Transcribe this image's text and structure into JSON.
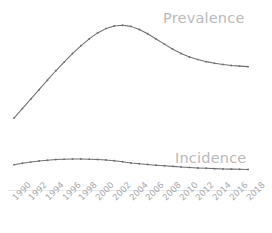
{
  "chart_data": {
    "type": "line",
    "title": "",
    "subtitle": "",
    "xlabel": "",
    "ylabel": "",
    "grid": false,
    "legend_position": "inline-right",
    "x": [
      1990,
      1991,
      1992,
      1993,
      1994,
      1995,
      1996,
      1997,
      1998,
      1999,
      2000,
      2001,
      2002,
      2003,
      2004,
      2005,
      2006,
      2007,
      2008,
      2009,
      2010,
      2011,
      2012,
      2013,
      2014,
      2015,
      2016,
      2017,
      2018
    ],
    "tick_labels": [
      "1990",
      "1992",
      "1994",
      "1996",
      "1998",
      "2000",
      "2002",
      "2004",
      "2006",
      "2008",
      "2010",
      "2012",
      "2014",
      "2016",
      "2018"
    ],
    "xlim": [
      1990,
      2018
    ],
    "ylim": [
      0,
      100
    ],
    "series": [
      {
        "name": "Prevalence",
        "color": "#6e6e74",
        "marker": "dot",
        "values": [
          39.5,
          45.0,
          50.5,
          56.0,
          61.5,
          67.0,
          72.0,
          77.0,
          81.5,
          85.5,
          89.0,
          91.5,
          93.0,
          93.5,
          92.8,
          91.0,
          88.5,
          85.5,
          82.5,
          79.5,
          77.0,
          75.0,
          73.5,
          72.3,
          71.4,
          70.7,
          70.1,
          69.7,
          69.4
        ]
      },
      {
        "name": "Incidence",
        "color": "#6e6e74",
        "marker": "dot",
        "values": [
          12.4,
          13.2,
          13.9,
          14.5,
          15.0,
          15.4,
          15.6,
          15.7,
          15.7,
          15.6,
          15.4,
          15.1,
          14.7,
          14.1,
          13.4,
          12.9,
          12.5,
          12.1,
          11.8,
          11.4,
          11.1,
          10.8,
          10.5,
          10.3,
          10.1,
          9.9,
          9.8,
          9.7,
          9.6
        ]
      }
    ]
  },
  "labels": {
    "prevalence": "Prevalence",
    "incidence": "Incidence"
  },
  "axis": {
    "tick_labels": [
      "1990",
      "1992",
      "1994",
      "1996",
      "1998",
      "2000",
      "2002",
      "2004",
      "2006",
      "2008",
      "2010",
      "2012",
      "2014",
      "2016",
      "2018"
    ]
  },
  "caption": {
    "text": ""
  },
  "colors": {
    "line": "#6e6e74",
    "label": "#b9b9bd",
    "tick": "#a9a9ae",
    "axis_line": "#e8e8ea",
    "background": "#ffffff"
  }
}
